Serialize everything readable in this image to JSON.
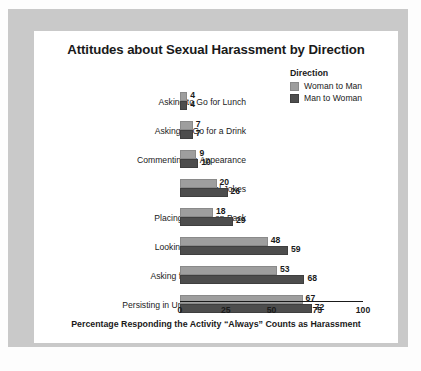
{
  "chart_data": {
    "type": "bar",
    "orientation": "horizontal",
    "title": "Attitudes about Sexual Harassment by Direction",
    "xlabel": "Percentage Responding the Activity “Always” Counts as Harassment",
    "ylabel": "",
    "xlim": [
      0,
      100
    ],
    "xticks": [
      0,
      25,
      50,
      75,
      100
    ],
    "xtick_labels": [
      "0",
      "25",
      "50",
      "75",
      "100"
    ],
    "grid": false,
    "legend_position": "top-right",
    "legend_title": "Direction",
    "categories": [
      "Asking to Go for Lunch",
      "Asking to Go for a Drink",
      "Commenting on Appearance",
      "Sexual Jokes",
      "Placing a Hand on Back",
      "Looking at Private Parts",
      "Asking for Sexual Favors",
      "Persisting in Unwanted Attention"
    ],
    "series": [
      {
        "name": "Woman to Man",
        "color": "#9e9e9e",
        "values": [
          4,
          7,
          9,
          20,
          18,
          48,
          53,
          67
        ]
      },
      {
        "name": "Man to Woman",
        "color": "#4d4d4d",
        "values": [
          4,
          7,
          10,
          26,
          29,
          59,
          68,
          72
        ]
      }
    ]
  },
  "colors": {
    "frame": "#c9c9c9",
    "card": "#ffffff",
    "text": "#1a1a1a",
    "series_light": "#9e9e9e",
    "series_dark": "#4d4d4d"
  }
}
